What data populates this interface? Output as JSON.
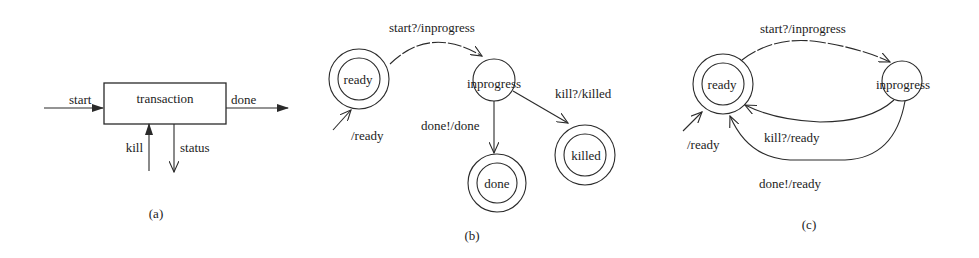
{
  "figure": {
    "panel_a": {
      "caption": "(a)",
      "box_label": "transaction",
      "ports": {
        "start": "start",
        "done": "done",
        "kill": "kill",
        "status": "status"
      }
    },
    "panel_b": {
      "caption": "(b)",
      "states": {
        "ready": "ready",
        "inprogress": "inprogress",
        "done": "done",
        "killed": "killed"
      },
      "transitions": {
        "initial": "/ready",
        "start": "start?/inprogress",
        "done": "done!/done",
        "kill": "kill?/killed"
      }
    },
    "panel_c": {
      "caption": "(c)",
      "states": {
        "ready": "ready",
        "inprogress": "inprogress"
      },
      "transitions": {
        "initial": "/ready",
        "start": "start?/inprogress",
        "kill": "kill?/ready",
        "done": "done!/ready"
      }
    }
  }
}
